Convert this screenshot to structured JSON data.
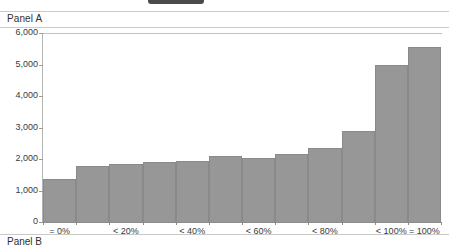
{
  "top_bar": {
    "pill_label": ""
  },
  "panel_a": {
    "title": "Panel A"
  },
  "panel_b": {
    "title": "Panel B"
  },
  "chart_data": {
    "type": "bar",
    "title": "Panel A",
    "xlabel": "",
    "ylabel": "",
    "ylim": [
      0,
      6000
    ],
    "ytick_labels": [
      "6,000",
      "5,000",
      "4,000",
      "3,000",
      "2,000",
      "1,000",
      "0"
    ],
    "ytick_values": [
      6000,
      5000,
      4000,
      3000,
      2000,
      1000,
      0
    ],
    "grid": false,
    "legend": "none",
    "categories": [
      "= 0%",
      "",
      "< 20%",
      "",
      "< 40%",
      "",
      "< 60%",
      "",
      "< 80%",
      "",
      "< 100%",
      "= 100%"
    ],
    "xtick_labels": [
      "= 0%",
      "< 20%",
      "< 40%",
      "< 60%",
      "< 80%",
      "< 100%",
      "= 100%"
    ],
    "values": [
      1350,
      1770,
      1830,
      1900,
      1950,
      2080,
      2020,
      2150,
      2340,
      2900,
      5000,
      5570
    ],
    "bar_color": "#979797",
    "bar_edge_color": "#8a8a8a",
    "plot_background": "#ffffff"
  },
  "colors": {
    "rule": "#c9c9c9",
    "axis": "#8c8c8c",
    "pill": "#4a4a4a",
    "text": "#2f2f2f"
  }
}
